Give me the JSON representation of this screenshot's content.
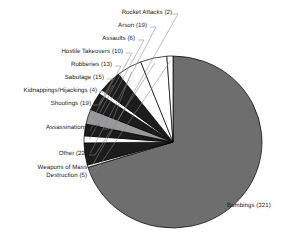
{
  "chart_data": {
    "type": "pie",
    "title": "",
    "subtitle": "",
    "xlabel": "",
    "ylabel": "",
    "legend_position": "callout-labels",
    "grid": false,
    "total": 457,
    "units": "incidents",
    "categories": [
      "Bombings",
      "Rocket Attacks",
      "Arson",
      "Assaults",
      "Hostile Takeovers",
      "Robberies",
      "Sabotage",
      "Kidnappings/Hijackings",
      "Shootings",
      "Assassinations",
      "Other",
      "Weapons of Mass Destruction"
    ],
    "values": [
      321,
      2,
      19,
      6,
      10,
      13,
      15,
      4,
      19,
      21,
      22,
      5
    ],
    "colors": [
      "#6e6e6e",
      "#ffffff",
      "#1c1c1c",
      "#ffffff",
      "#1c1c1c",
      "#9a9a9a",
      "#1c1c1c",
      "#ffffff",
      "#1c1c1c",
      "#ffffff",
      "#ffffff",
      "#ffffff"
    ],
    "slices": [
      {
        "label": "Bombings",
        "value": 321,
        "display": "Bombings (321)",
        "color": "#6e6e6e"
      },
      {
        "label": "Rocket Attacks",
        "value": 2,
        "display": "Rocket Attacks (2)",
        "color": "#ffffff"
      },
      {
        "label": "Arson",
        "value": 19,
        "display": "Arson (19)",
        "color": "#1c1c1c"
      },
      {
        "label": "Assaults",
        "value": 6,
        "display": "Assaults (6)",
        "color": "#ffffff"
      },
      {
        "label": "Hostile Takeovers",
        "value": 10,
        "display": "Hostile Takeovers (10)",
        "color": "#1c1c1c"
      },
      {
        "label": "Robberies",
        "value": 13,
        "display": "Robberies (13)",
        "color": "#9a9a9a"
      },
      {
        "label": "Sabotage",
        "value": 15,
        "display": "Sabotage (15)",
        "color": "#1c1c1c"
      },
      {
        "label": "Kidnappings/Hijackings",
        "value": 4,
        "display": "Kidnappings/Hijackings (4)",
        "color": "#ffffff"
      },
      {
        "label": "Shootings",
        "value": 19,
        "display": "Shootings (19)",
        "color": "#1c1c1c"
      },
      {
        "label": "Assassinations",
        "value": 21,
        "display": "Assassinations (21)",
        "color": "#ffffff"
      },
      {
        "label": "Other",
        "value": 22,
        "display": "Other (22)",
        "color": "#ffffff"
      },
      {
        "label": "Weapons of Mass Destruction",
        "value": 5,
        "display": "Weapons of Mass Destruction (5)",
        "color": "#ffffff"
      }
    ]
  },
  "labels": {
    "rocket_attacks": "Rocket Attacks (2)",
    "arson": "Arson (19)",
    "assaults": "Assaults (6)",
    "hostile_takeovers": "Hostile Takeovers (10)",
    "robberies": "Robberies (13)",
    "sabotage": "Sabotage (15)",
    "kidnappings_hijackings": "Kidnappings/Hijackings (4)",
    "shootings": "Shootings (19)",
    "assassinations": "Assassinations (21)",
    "other": "Other (22)",
    "wmd_line1": "Weapons of Mass",
    "wmd_line2": "Destruction (5)",
    "bombings": "Bombings (321)"
  },
  "style": {
    "slice_dark": "#1c1c1c",
    "slice_mid_gray": "#9a9a9a",
    "slice_main_gray": "#6e6e6e",
    "slice_white": "#ffffff",
    "outline": "#000000",
    "leader_line": "#888888",
    "text": "#1a1a1a",
    "background": "#ffffff"
  }
}
